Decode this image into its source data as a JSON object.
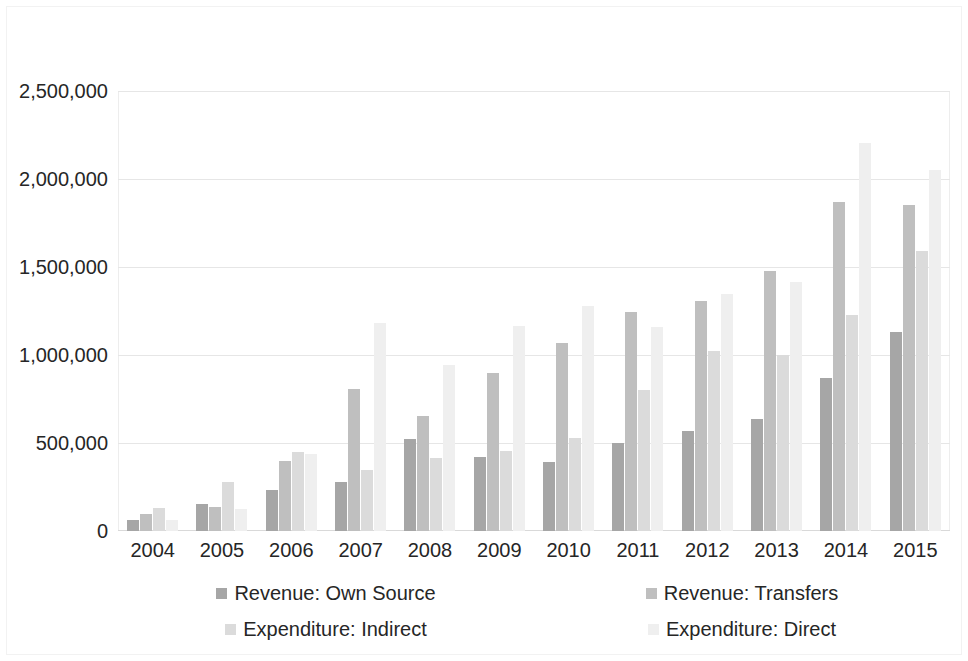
{
  "chart_data": {
    "type": "bar",
    "title": "",
    "subtitle": "",
    "xlabel": "",
    "ylabel": "",
    "grid": true,
    "legend_position": "bottom",
    "ylim": [
      0,
      2500000
    ],
    "ytick_labels": [
      "0",
      "500,000",
      "1,000,000",
      "1,500,000",
      "2,000,000",
      "2,500,000"
    ],
    "ytick_values": [
      0,
      500000,
      1000000,
      1500000,
      2000000,
      2500000
    ],
    "categories": [
      "2004",
      "2005",
      "2006",
      "2007",
      "2008",
      "2009",
      "2010",
      "2011",
      "2012",
      "2013",
      "2014",
      "2015"
    ],
    "series": [
      {
        "name": "Revenue: Own Source",
        "color": "#a6a6a6",
        "values": [
          65000,
          155000,
          235000,
          280000,
          520000,
          420000,
          390000,
          500000,
          570000,
          635000,
          870000,
          1130000
        ]
      },
      {
        "name": "Revenue: Transfers",
        "color": "#bfbfbf",
        "values": [
          95000,
          135000,
          395000,
          805000,
          655000,
          900000,
          1070000,
          1245000,
          1305000,
          1475000,
          1870000,
          1855000
        ]
      },
      {
        "name": "Expenditure: Indirect",
        "color": "#dbdbdb",
        "values": [
          130000,
          280000,
          450000,
          345000,
          415000,
          455000,
          530000,
          800000,
          1020000,
          1000000,
          1225000,
          1590000
        ]
      },
      {
        "name": "Expenditure: Direct",
        "color": "#efefef",
        "values": [
          60000,
          125000,
          440000,
          1180000,
          945000,
          1165000,
          1280000,
          1160000,
          1345000,
          1415000,
          2205000,
          2050000
        ]
      }
    ]
  }
}
